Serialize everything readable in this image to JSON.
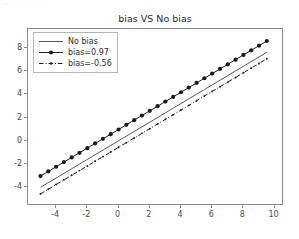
{
  "top_strip": {
    "text": "····· ···· ···· ··· ·"
  },
  "chart_data": {
    "type": "line",
    "title": "bias VS No bias",
    "xlabel": "",
    "ylabel": "",
    "xlim": [
      -5.8,
      10.6
    ],
    "ylim": [
      -5.6,
      9.6
    ],
    "xticks": [
      -4,
      -2,
      0,
      2,
      4,
      6,
      8,
      10
    ],
    "xticklabels": [
      "-4",
      "-2",
      "0",
      "2",
      "4",
      "6",
      "8",
      "10"
    ],
    "yticks": [
      -4,
      -2,
      0,
      2,
      4,
      6,
      8
    ],
    "yticklabels": [
      "-4",
      "-2",
      "0",
      "2",
      "4",
      "6",
      "8"
    ],
    "grid": false,
    "legend_position": "upper left",
    "x": [
      -5.0,
      -4.5,
      -4.0,
      -3.5,
      -3.0,
      -2.5,
      -2.0,
      -1.5,
      -1.0,
      -0.5,
      0.0,
      0.5,
      1.0,
      1.5,
      2.0,
      2.5,
      3.0,
      3.5,
      4.0,
      4.5,
      5.0,
      5.5,
      6.0,
      6.5,
      7.0,
      7.5,
      8.0,
      8.5,
      9.0,
      9.5
    ],
    "series": [
      {
        "name": "No bias",
        "style": "solid",
        "marker": "none",
        "color": "#444444",
        "linewidth": 0.9,
        "slope": 0.8,
        "intercept": 0.0,
        "values": [
          -4.0,
          -3.6,
          -3.2,
          -2.8,
          -2.4,
          -2.0,
          -1.6,
          -1.2,
          -0.8,
          -0.4,
          0.0,
          0.4,
          0.8,
          1.2,
          1.6,
          2.0,
          2.4,
          2.8,
          3.2,
          3.6,
          4.0,
          4.4,
          4.8,
          5.2,
          5.6,
          6.0,
          6.4,
          6.8,
          7.2,
          7.6
        ]
      },
      {
        "name": "bias=0.97",
        "style": "solid",
        "marker": "circle",
        "color": "#1c1c1c",
        "linewidth": 1.0,
        "markersize": 4.2,
        "slope": 0.8,
        "intercept": 0.97,
        "values": [
          -3.03,
          -2.63,
          -2.23,
          -1.83,
          -1.43,
          -1.03,
          -0.63,
          -0.23,
          0.17,
          0.57,
          0.97,
          1.37,
          1.77,
          2.17,
          2.57,
          2.97,
          3.37,
          3.77,
          4.17,
          4.57,
          4.97,
          5.37,
          5.77,
          6.17,
          6.57,
          6.97,
          7.37,
          7.77,
          8.17,
          8.57
        ]
      },
      {
        "name": "bias=-0.56",
        "style": "dashdot",
        "marker": "small-circle",
        "color": "#1c1c1c",
        "linewidth": 1.0,
        "markersize": 1.9,
        "slope": 0.8,
        "intercept": -0.56,
        "values": [
          -4.56,
          -4.16,
          -3.76,
          -3.36,
          -2.96,
          -2.56,
          -2.16,
          -1.76,
          -1.36,
          -0.96,
          -0.56,
          -0.16,
          0.24,
          0.64,
          1.04,
          1.44,
          1.84,
          2.24,
          2.64,
          3.04,
          3.44,
          3.84,
          4.24,
          4.64,
          5.04,
          5.44,
          5.84,
          6.24,
          6.64,
          7.04
        ]
      }
    ]
  }
}
